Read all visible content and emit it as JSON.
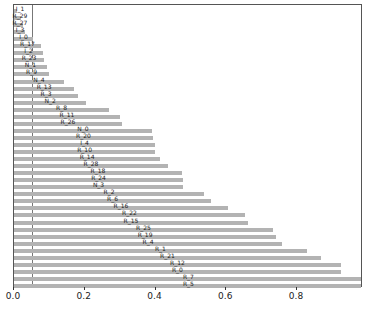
{
  "chart_data": {
    "type": "bar",
    "orientation": "horizontal",
    "title": "",
    "xlabel": "",
    "ylabel": "",
    "xlim": [
      0,
      0.986
    ],
    "xticks": [
      "0.0",
      "0.2",
      "0.4",
      "0.6",
      "0.8"
    ],
    "reference_line_x": 0.05,
    "bar_color": "#b3b3b3",
    "categories": [
      "I_1",
      "R_29",
      "R_27",
      "I_3",
      "I_0",
      "R_17",
      "I_2",
      "R_23",
      "N_1",
      "R_9",
      "N_4",
      "R_13",
      "R_3",
      "N_2",
      "R_8",
      "R_11",
      "R_26",
      "N_0",
      "R_20",
      "I_4",
      "R_10",
      "R_14",
      "R_28",
      "R_18",
      "R_24",
      "N_3",
      "R_2",
      "R_6",
      "R_16",
      "R_22",
      "R_15",
      "R_25",
      "R_19",
      "R_4",
      "R_1",
      "R_21",
      "R_12",
      "R_0",
      "R_7",
      "R_5"
    ],
    "values": [
      0.008,
      0.02,
      0.025,
      0.03,
      0.054,
      0.076,
      0.082,
      0.085,
      0.093,
      0.099,
      0.141,
      0.17,
      0.181,
      0.204,
      0.269,
      0.299,
      0.305,
      0.39,
      0.393,
      0.399,
      0.399,
      0.413,
      0.435,
      0.475,
      0.478,
      0.478,
      0.537,
      0.557,
      0.605,
      0.653,
      0.661,
      0.732,
      0.741,
      0.758,
      0.828,
      0.868,
      0.924,
      0.924,
      0.986,
      0.986
    ]
  }
}
